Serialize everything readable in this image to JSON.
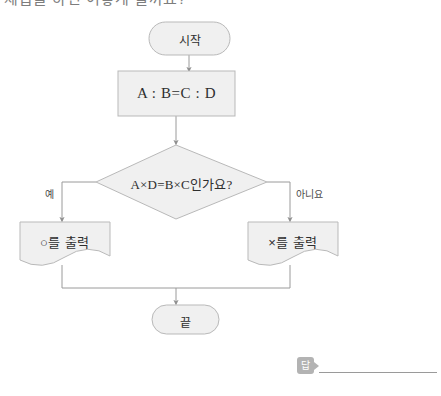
{
  "page": {
    "top_cut_text": "제곱을 하면 어떻게 될까요?",
    "background": "#ffffff"
  },
  "style": {
    "shape_fill": "#f0f0f0",
    "shape_stroke": "#b9b9b9",
    "connector_color": "#9a9a9a",
    "text_color": "#2e2e2e"
  },
  "flowchart": {
    "nodes": {
      "start": {
        "label": "시작",
        "shape": "terminator"
      },
      "process": {
        "label": "A : B=C : D",
        "shape": "process"
      },
      "decision": {
        "label": "A×D=B×C인가요?",
        "shape": "decision"
      },
      "output_yes": {
        "label": "○를 출력",
        "shape": "document"
      },
      "output_no": {
        "label": "×를 출력",
        "shape": "document"
      },
      "end": {
        "label": "끝",
        "shape": "terminator"
      }
    },
    "edges": [
      {
        "from": "start",
        "to": "process",
        "label": ""
      },
      {
        "from": "process",
        "to": "decision",
        "label": ""
      },
      {
        "from": "decision",
        "to": "output_yes",
        "label": "예"
      },
      {
        "from": "decision",
        "to": "output_no",
        "label": "아니요"
      },
      {
        "from": "output_yes",
        "to": "end",
        "label": ""
      },
      {
        "from": "output_no",
        "to": "end",
        "label": ""
      }
    ],
    "branch_labels": {
      "yes": "예",
      "no": "아니요"
    }
  },
  "answer": {
    "badge_label": "답",
    "value": ""
  }
}
